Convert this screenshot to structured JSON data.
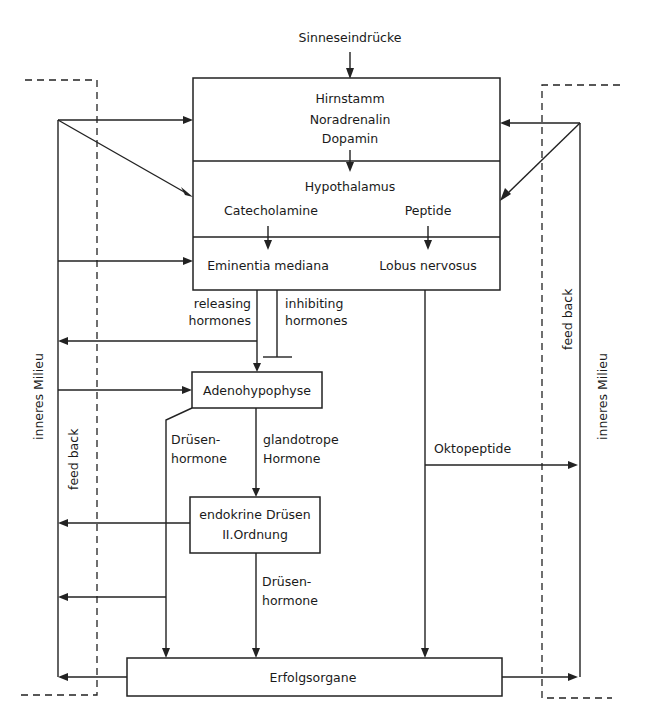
{
  "diagram": {
    "input": {
      "label": "Sinneseindrücke"
    },
    "main_box": {
      "hirnstamm": {
        "title": "Hirnstamm",
        "line1": "Noradrenalin",
        "line2": "Dopamin"
      },
      "hypothalamus": {
        "title": "Hypothalamus",
        "left": "Catecholamine",
        "right": "Peptide"
      },
      "bottom": {
        "left": "Eminentia mediana",
        "right": "Lobus nervosus"
      }
    },
    "releasing": {
      "line1": "releasing",
      "line2": "hormones"
    },
    "inhibiting": {
      "line1": "inhibiting",
      "line2": "hormones"
    },
    "adenohypophyse": {
      "label": "Adenohypophyse"
    },
    "druesen_left": {
      "line1": "Drüsen-",
      "line2": "hormone"
    },
    "glandotrope": {
      "line1": "glandotrope",
      "line2": "Hormone"
    },
    "endokrine": {
      "line1": "endokrine Drüsen",
      "line2": "II.Ordnung"
    },
    "druesen_mid": {
      "line1": "Drüsen-",
      "line2": "hormone"
    },
    "oktopeptide": {
      "label": "Oktopeptide"
    },
    "erfolgsorgane": {
      "label": "Erfolgsorgane"
    },
    "left_side": {
      "milieu": "inneres Milieu",
      "feedback": "feed back"
    },
    "right_side": {
      "milieu": "inneres Milieu",
      "feedback": "feed back"
    }
  }
}
